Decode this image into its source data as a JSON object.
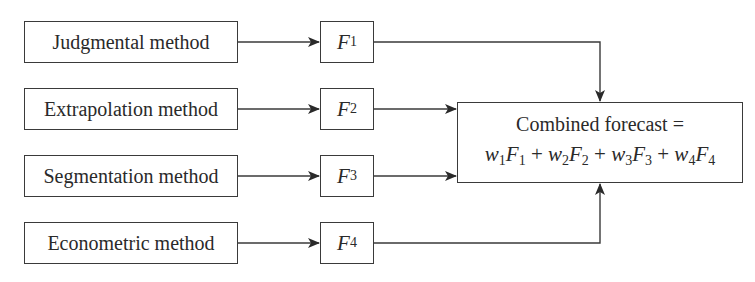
{
  "diagram": {
    "methods": [
      {
        "label": "Judgmental method",
        "forecast_var": "F",
        "forecast_sub": "1"
      },
      {
        "label": "Extrapolation method",
        "forecast_var": "F",
        "forecast_sub": "2"
      },
      {
        "label": "Segmentation method",
        "forecast_var": "F",
        "forecast_sub": "3"
      },
      {
        "label": "Econometric method",
        "forecast_var": "F",
        "forecast_sub": "4"
      }
    ],
    "combined": {
      "title": "Combined forecast =",
      "terms": [
        {
          "w": "w",
          "wsub": "1",
          "f": "F",
          "fsub": "1"
        },
        {
          "w": "w",
          "wsub": "2",
          "f": "F",
          "fsub": "2"
        },
        {
          "w": "w",
          "wsub": "3",
          "f": "F",
          "fsub": "3"
        },
        {
          "w": "w",
          "wsub": "4",
          "f": "F",
          "fsub": "4"
        }
      ],
      "operator": "+"
    },
    "colors": {
      "line": "#3a3a3a",
      "text": "#2a2a2a",
      "background": "#ffffff"
    }
  }
}
